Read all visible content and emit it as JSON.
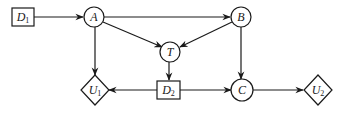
{
  "diagram": {
    "type": "influence-diagram",
    "colors": {
      "stroke": "#1a1a1a",
      "background": "#ffffff"
    },
    "nodes": [
      {
        "id": "D1",
        "kind": "decision",
        "shape": "rectangle",
        "label": "D",
        "subscript": "1"
      },
      {
        "id": "A",
        "kind": "chance",
        "shape": "circle",
        "label": "A",
        "subscript": ""
      },
      {
        "id": "B",
        "kind": "chance",
        "shape": "circle",
        "label": "B",
        "subscript": ""
      },
      {
        "id": "T",
        "kind": "chance",
        "shape": "circle",
        "label": "T",
        "subscript": ""
      },
      {
        "id": "U1",
        "kind": "utility",
        "shape": "diamond",
        "label": "U",
        "subscript": "1"
      },
      {
        "id": "D2",
        "kind": "decision",
        "shape": "rectangle",
        "label": "D",
        "subscript": "2"
      },
      {
        "id": "C",
        "kind": "chance",
        "shape": "circle",
        "label": "C",
        "subscript": ""
      },
      {
        "id": "U2",
        "kind": "utility",
        "shape": "diamond",
        "label": "U",
        "subscript": "2"
      }
    ],
    "edges": [
      {
        "from": "D1",
        "to": "A"
      },
      {
        "from": "A",
        "to": "B"
      },
      {
        "from": "A",
        "to": "T"
      },
      {
        "from": "B",
        "to": "T"
      },
      {
        "from": "A",
        "to": "U1"
      },
      {
        "from": "T",
        "to": "D2"
      },
      {
        "from": "D2",
        "to": "U1"
      },
      {
        "from": "D2",
        "to": "C"
      },
      {
        "from": "B",
        "to": "C"
      },
      {
        "from": "C",
        "to": "U2"
      }
    ]
  }
}
